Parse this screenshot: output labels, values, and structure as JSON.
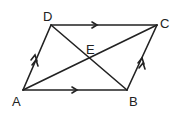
{
  "diagram": {
    "labels": {
      "A": "A",
      "B": "B",
      "C": "C",
      "D": "D",
      "E": "E"
    },
    "stroke_color": "#222222",
    "background": "#ffffff"
  }
}
